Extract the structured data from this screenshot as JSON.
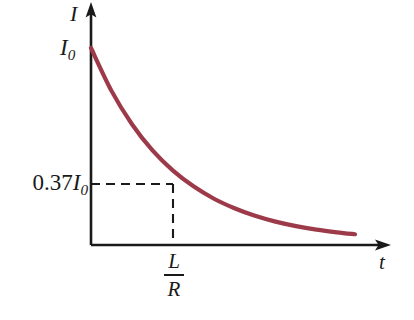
{
  "figure": {
    "kind": "line-chart",
    "background_color": "#ffffff",
    "axis_color": "#1a1a1a",
    "curve_color": "#9d3a4a",
    "dash_color": "#1a1a1a"
  },
  "labels": {
    "y_axis": "I",
    "x_axis": "t",
    "initial_current": "I",
    "initial_current_sub": "0",
    "decay_value_prefix": "0.37",
    "decay_value_symbol": "I",
    "decay_value_sub": "0",
    "time_constant_numerator": "L",
    "time_constant_denominator": "R"
  },
  "chart_data": {
    "type": "line",
    "title": "",
    "xlabel": "t",
    "ylabel": "I",
    "grid": false,
    "legend": "none",
    "xlim": [
      0,
      6
    ],
    "ylim": [
      0,
      1.08
    ],
    "series": [
      {
        "name": "I(t) = I0 e^(-tR/L)",
        "color": "#9d3a4a",
        "x": [
          0.0,
          0.25,
          0.5,
          0.75,
          1.0,
          1.25,
          1.5,
          1.75,
          2.0,
          2.25,
          2.5,
          2.75,
          3.0,
          3.25,
          3.5,
          3.75,
          4.0,
          4.25,
          4.5,
          4.75,
          5.0,
          5.25,
          5.5,
          5.75,
          6.0
        ],
        "y": [
          1.0,
          0.779,
          0.607,
          0.472,
          0.368,
          0.287,
          0.223,
          0.174,
          0.135,
          0.105,
          0.082,
          0.064,
          0.05,
          0.039,
          0.03,
          0.024,
          0.018,
          0.014,
          0.011,
          0.009,
          0.007,
          0.005,
          0.004,
          0.003,
          0.002
        ]
      }
    ],
    "annotations": [
      {
        "name": "initial-value",
        "axis": "y",
        "value": 1.0,
        "label": "I0"
      },
      {
        "name": "one-time-constant-value",
        "axis": "y",
        "value": 0.37,
        "label": "0.37 I0",
        "guide": "dashed"
      },
      {
        "name": "time-constant",
        "axis": "x",
        "value": 1.0,
        "label": "L/R",
        "guide": "dashed"
      }
    ],
    "ytick_labels": [
      "0.37I0",
      "I0"
    ],
    "xtick_labels": [
      "L/R"
    ]
  }
}
